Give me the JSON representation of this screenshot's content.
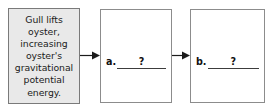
{
  "diagram": {
    "colors": {
      "box_fill_highlight": "#e9e9e9",
      "box_fill_blank": "#ffffff",
      "box_border": "#8c8c8c",
      "text": "#1b1b1b",
      "arrow": "#1b1b1b",
      "blank_rule": "#3c3c3c"
    },
    "steps": [
      {
        "id": "cause",
        "kind": "filled-text-box",
        "text": "Gull lifts oyster, increasing oyster's gravitational potential energy."
      },
      {
        "id": "effect-a",
        "kind": "blank-answer-box",
        "label": "a.",
        "blank_mark": "?"
      },
      {
        "id": "effect-b",
        "kind": "blank-answer-box",
        "label": "b.",
        "blank_mark": "?"
      }
    ],
    "connectors": [
      {
        "id": "arrow-1",
        "icon": "arrow-right-icon",
        "from": "cause",
        "to": "effect-a"
      },
      {
        "id": "arrow-2",
        "icon": "arrow-right-icon",
        "from": "effect-a",
        "to": "effect-b"
      }
    ]
  }
}
